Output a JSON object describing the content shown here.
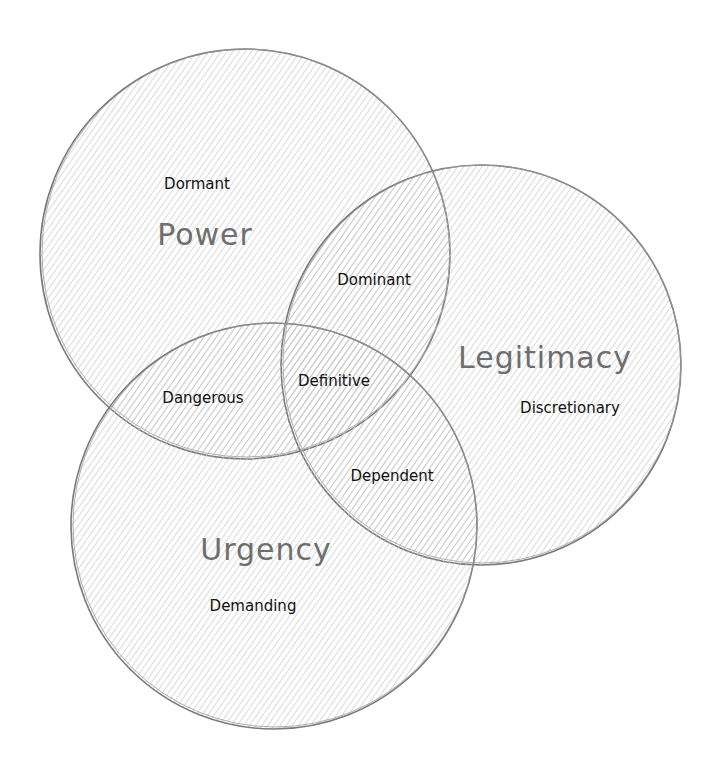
{
  "diagram": {
    "type": "venn",
    "colors": {
      "stroke": "#7a7a7a",
      "hatch": "#b8b8b8",
      "set_label": "#6e6e6e",
      "region_label": "#111111"
    },
    "sets": [
      {
        "id": "power",
        "label": "Power",
        "cx": 245,
        "cy": 254,
        "r": 205
      },
      {
        "id": "legitimacy",
        "label": "Legitimacy",
        "cx": 481,
        "cy": 365,
        "r": 200
      },
      {
        "id": "urgency",
        "label": "Urgency",
        "cx": 274,
        "cy": 526,
        "r": 203
      }
    ],
    "set_labels": {
      "power": "Power",
      "legitimacy": "Legitimacy",
      "urgency": "Urgency"
    },
    "regions": {
      "dormant": "Dormant",
      "discretionary": "Discretionary",
      "demanding": "Demanding",
      "dominant": "Dominant",
      "dangerous": "Dangerous",
      "dependent": "Dependent",
      "definitive": "Definitive"
    }
  }
}
